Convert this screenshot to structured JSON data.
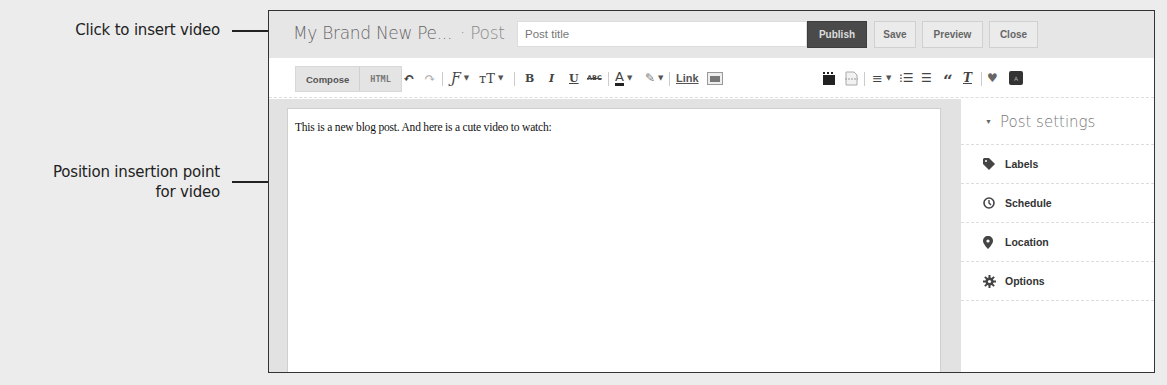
{
  "callouts": {
    "insert_video": "Click to insert video",
    "insertion_point_line1": "Position insertion point",
    "insertion_point_line2": "for video"
  },
  "header": {
    "blog_title": "My Brand New Pe...",
    "separator": "· Post",
    "post_title_placeholder": "Post title",
    "buttons": {
      "publish": "Publish",
      "save": "Save",
      "preview": "Preview",
      "close": "Close"
    }
  },
  "toolbar": {
    "modes": {
      "compose": "Compose",
      "html": "HTML"
    },
    "active_mode": "Compose",
    "tools": [
      {
        "name": "undo-icon",
        "glyph": "↶"
      },
      {
        "name": "redo-icon",
        "glyph": "↷"
      },
      {
        "name": "font-family-icon",
        "glyph": "Ƒ"
      },
      {
        "name": "font-size-icon",
        "glyph": "тT"
      },
      {
        "name": "bold-icon",
        "glyph": "B"
      },
      {
        "name": "italic-icon",
        "glyph": "I"
      },
      {
        "name": "underline-icon",
        "glyph": "U"
      },
      {
        "name": "strikethrough-icon",
        "glyph": "ABC"
      },
      {
        "name": "text-color-icon",
        "glyph": "A"
      },
      {
        "name": "highlight-icon",
        "glyph": "✎"
      },
      {
        "name": "link-label",
        "glyph": "Link"
      },
      {
        "name": "insert-image-icon",
        "glyph": ""
      },
      {
        "name": "insert-video-icon",
        "glyph": ""
      },
      {
        "name": "insert-jump-break-icon",
        "glyph": ""
      },
      {
        "name": "alignment-icon",
        "glyph": "≡"
      },
      {
        "name": "numbered-list-icon",
        "glyph": "☰"
      },
      {
        "name": "bullet-list-icon",
        "glyph": "☰"
      },
      {
        "name": "quote-icon",
        "glyph": "“"
      },
      {
        "name": "remove-formatting-icon",
        "glyph": "T"
      },
      {
        "name": "spellcheck-icon",
        "glyph": "✔"
      },
      {
        "name": "input-tools-icon",
        "glyph": "अ"
      }
    ]
  },
  "editor": {
    "content": "This is a new blog post. And here is a cute video to watch:"
  },
  "sidebar": {
    "title": "Post settings",
    "items": [
      {
        "label": "Labels",
        "icon": "tag-icon"
      },
      {
        "label": "Schedule",
        "icon": "clock-icon"
      },
      {
        "label": "Location",
        "icon": "map-pin-icon"
      },
      {
        "label": "Options",
        "icon": "gear-icon"
      }
    ]
  },
  "colors": {
    "publish_bg": "#4a4a4a",
    "header_bg": "#e6e6e6",
    "editor_bg": "#e2e2e2"
  }
}
